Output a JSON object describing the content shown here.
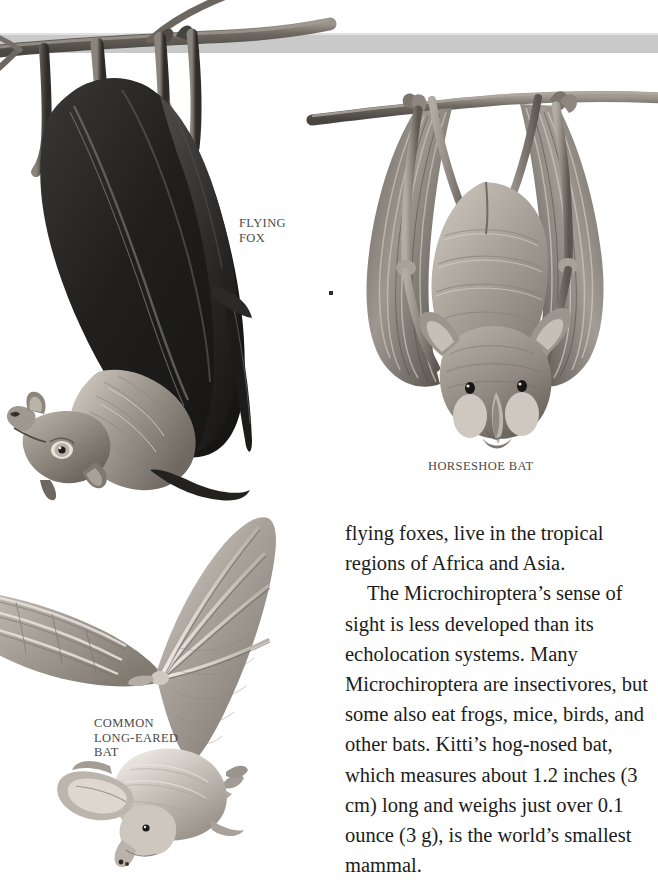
{
  "page": {
    "width": 658,
    "height": 880,
    "background_color": "#ffffff",
    "kind": "book-page-illustration"
  },
  "top_band": {
    "name": "horizontal-gray-band",
    "color": "#c9c9c9",
    "highlight_color": "#e2e2e2"
  },
  "illustrations": [
    {
      "id": "flying-fox",
      "subject": "Flying fox bat hanging upside down from a branch with wings wrapped around its body",
      "palette": {
        "dark": "#232323",
        "mid": "#5c5a58",
        "light": "#b9b4ae",
        "branch": "#6f6a64"
      }
    },
    {
      "id": "horseshoe-bat",
      "subject": "Horseshoe bat hanging upside down from a branch, wings spread showing membrane and finger bones",
      "palette": {
        "dark": "#3b3936",
        "mid": "#8d8881",
        "light": "#cfc9c1",
        "branch": "#7d7871"
      }
    },
    {
      "id": "common-long-eared-bat",
      "subject": "Common long-eared bat in flight with one wing raised showing finger bones, large ears folded back",
      "palette": {
        "dark": "#6e6a65",
        "mid": "#a9a49d",
        "light": "#e0dcd6"
      }
    }
  ],
  "captions": {
    "flying_fox": "FLYING\nFOX",
    "horseshoe_bat": "HORSESHOE BAT",
    "common_long_eared_bat": "COMMON\nLONG-EARED\nBAT"
  },
  "body_text": {
    "paragraphs": [
      {
        "indent": false,
        "text": "flying foxes, live in the tropical regions of Africa and Asia."
      },
      {
        "indent": true,
        "text": "The Microchiroptera’s sense of sight is less developed than its echolocation systems. Many Microchiroptera are insectivores, but some also eat frogs, mice, birds, and other bats.  Kitti’s hog-nosed bat, which measures about 1.2 inches (3 cm) long and weighs just over 0.1 ounce (3 g), is the world’s smallest mammal."
      }
    ]
  }
}
